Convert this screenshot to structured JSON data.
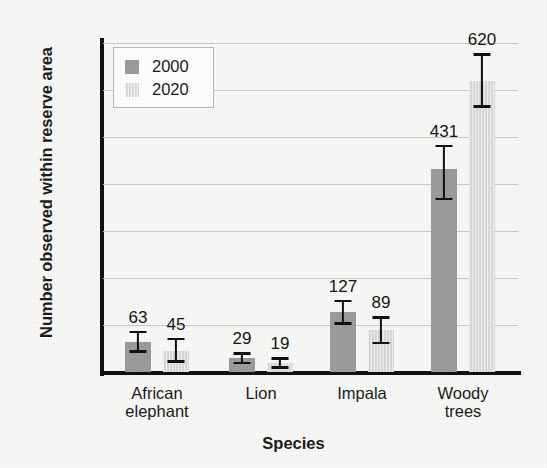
{
  "chart_data": {
    "type": "bar",
    "title": "",
    "xlabel": "Species",
    "ylabel": "Number observed within reserve area",
    "categories": [
      "African elephant",
      "Lion",
      "Impala",
      "Woody trees"
    ],
    "ylim": [
      0,
      700
    ],
    "yticks": [
      0,
      100,
      200,
      300,
      400,
      500,
      600,
      700
    ],
    "ytick_labels": [
      "0",
      "100",
      "200",
      "300",
      "400",
      "500",
      "600",
      "700"
    ],
    "grid": "horizontal",
    "legend_position": "top-left",
    "series": [
      {
        "name": "2000",
        "color": "#9a9b9c",
        "values": [
          63,
          29,
          127,
          431
        ],
        "value_labels": [
          "63",
          "29",
          "127",
          "431"
        ],
        "error_low": [
          44,
          20,
          104,
          368
        ],
        "error_high": [
          86,
          40,
          151,
          481
        ]
      },
      {
        "name": "2020",
        "color": "#d7d8d9",
        "values": [
          45,
          19,
          89,
          620
        ],
        "value_labels": [
          "45",
          "19",
          "89",
          "620"
        ],
        "error_low": [
          23,
          10,
          62,
          565
        ],
        "error_high": [
          70,
          29,
          116,
          676
        ]
      }
    ]
  },
  "legend": {
    "items": [
      {
        "label": "2000",
        "swatch": "y2000"
      },
      {
        "label": "2020",
        "swatch": "y2020"
      }
    ]
  },
  "axes": {
    "y_title": "Number observed within reserve area",
    "x_title": "Species"
  }
}
